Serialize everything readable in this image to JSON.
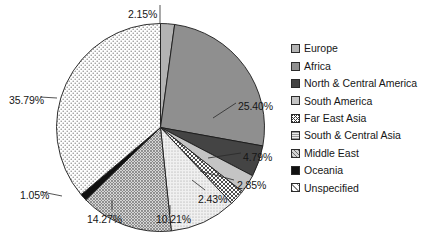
{
  "chart_data": {
    "type": "pie",
    "title": "",
    "subtitle": "",
    "xlabel": "",
    "ylabel": "",
    "legend_position": "right",
    "grid": false,
    "unit": "%",
    "start_angle_deg": 0,
    "direction": "clockwise",
    "categories": [
      "Europe",
      "Africa",
      "North & Central America",
      "South America",
      "Far East Asia",
      "South & Central Asia",
      "Middle East",
      "Oceania",
      "Unspecified"
    ],
    "values": [
      2.15,
      25.4,
      4.79,
      2.85,
      2.43,
      10.21,
      14.27,
      1.05,
      35.79
    ],
    "labels": [
      "2.15%",
      "25.40%",
      "4.79%",
      "2.85%",
      "2.43%",
      "10.21%",
      "14.27%",
      "1.05%",
      "35.79%"
    ],
    "slices": [
      {
        "name": "Europe",
        "value": 2.15,
        "label": "2.15%",
        "fill": "#b3b3b3",
        "pattern": "solid"
      },
      {
        "name": "Africa",
        "value": 25.4,
        "label": "25.40%",
        "fill": "#8f8f8f",
        "pattern": "solid"
      },
      {
        "name": "North & Central America",
        "value": 4.79,
        "label": "4.79%",
        "fill": "#444444",
        "pattern": "solid"
      },
      {
        "name": "South America",
        "value": 2.85,
        "label": "2.85%",
        "fill": "#c4c4c4",
        "pattern": "solid"
      },
      {
        "name": "Far East Asia",
        "value": 2.43,
        "label": "2.43%",
        "fill": "#ffffff",
        "pattern": "crosshatch"
      },
      {
        "name": "South & Central Asia",
        "value": 10.21,
        "label": "10.21%",
        "fill": "#e8e8e8",
        "pattern": "fine-dot"
      },
      {
        "name": "Middle East",
        "value": 14.27,
        "label": "14.27%",
        "fill": "#c9c9c9",
        "pattern": "coarse-dot"
      },
      {
        "name": "Oceania",
        "value": 1.05,
        "label": "1.05%",
        "fill": "#111111",
        "pattern": "solid"
      },
      {
        "name": "Unspecified",
        "value": 35.79,
        "label": "35.79%",
        "fill": "#ffffff",
        "pattern": "open-dot"
      }
    ]
  },
  "legend": {
    "items": [
      {
        "label": "Europe"
      },
      {
        "label": "Africa"
      },
      {
        "label": "North & Central America"
      },
      {
        "label": "South America"
      },
      {
        "label": "Far East Asia"
      },
      {
        "label": "South & Central Asia"
      },
      {
        "label": "Middle East"
      },
      {
        "label": "Oceania"
      },
      {
        "label": "Unspecified"
      }
    ]
  },
  "callouts": [
    {
      "label": "2.15%",
      "x": 128,
      "y": 9
    },
    {
      "label": "25.40%",
      "x": 238,
      "y": 101
    },
    {
      "label": "4.79%",
      "x": 243,
      "y": 152
    },
    {
      "label": "2.85%",
      "x": 237,
      "y": 180
    },
    {
      "label": "2.43%",
      "x": 198,
      "y": 194
    },
    {
      "label": "10.21%",
      "x": 156,
      "y": 214
    },
    {
      "label": "14.27%",
      "x": 87,
      "y": 214
    },
    {
      "label": "1.05%",
      "x": 20,
      "y": 190
    },
    {
      "label": "35.79%",
      "x": 9,
      "y": 95
    }
  ]
}
